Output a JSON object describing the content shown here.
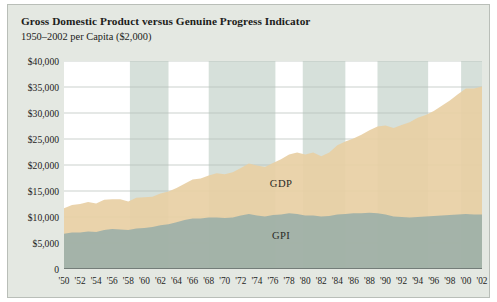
{
  "figure": {
    "title": "Gross Domestic Product versus Genuine Progress Indicator",
    "subtitle": "1950–2002 per Capita ($2,000)",
    "panel_bg": "#e4e8e2",
    "plot_bg": "#ffffff",
    "border_color": "#b9beb8"
  },
  "chart_data": {
    "type": "area",
    "title": "Gross Domestic Product versus Genuine Progress Indicator",
    "subtitle": "1950–2002 per Capita ($2,000)",
    "xlabel": "",
    "ylabel": "",
    "xlim": [
      1950,
      2002
    ],
    "ylim": [
      0,
      40000
    ],
    "grid": true,
    "legend": "inline-labels",
    "ytick_values": [
      0,
      5000,
      10000,
      15000,
      20000,
      25000,
      30000,
      35000,
      40000
    ],
    "ytick_labels": [
      "0",
      "$5,000",
      "$10,000",
      "$15,000",
      "$20,000",
      "$25,000",
      "$30,000",
      "$35,000",
      "$40,000"
    ],
    "xtick_values": [
      1950,
      1952,
      1954,
      1956,
      1958,
      1960,
      1962,
      1964,
      1966,
      1968,
      1970,
      1972,
      1974,
      1976,
      1978,
      1980,
      1982,
      1984,
      1986,
      1988,
      1990,
      1992,
      1994,
      1996,
      1998,
      2000,
      2002
    ],
    "xtick_labels": [
      "'50",
      "'52",
      "'54",
      "'56",
      "'58",
      "'60",
      "'62",
      "'64",
      "'66",
      "'68",
      "'70",
      "'72",
      "'74",
      "'76",
      "'78",
      "'80",
      "'82",
      "'84",
      "'86",
      "'88",
      "'90",
      "'92",
      "'94",
      "'96",
      "'98",
      "'00",
      "'02"
    ],
    "x": [
      1950,
      1951,
      1952,
      1953,
      1954,
      1955,
      1956,
      1957,
      1958,
      1959,
      1960,
      1961,
      1962,
      1963,
      1964,
      1965,
      1966,
      1967,
      1968,
      1969,
      1970,
      1971,
      1972,
      1973,
      1974,
      1975,
      1976,
      1977,
      1978,
      1979,
      1980,
      1981,
      1982,
      1983,
      1984,
      1985,
      1986,
      1987,
      1988,
      1989,
      1990,
      1991,
      1992,
      1993,
      1994,
      1995,
      1996,
      1997,
      1998,
      1999,
      2000,
      2001,
      2002
    ],
    "series": [
      {
        "name": "GDP",
        "label": "GDP",
        "color": "#e8cfa4",
        "values": [
          11700,
          12300,
          12500,
          12900,
          12600,
          13300,
          13400,
          13400,
          13000,
          13700,
          13800,
          13900,
          14500,
          14900,
          15600,
          16400,
          17200,
          17400,
          18000,
          18400,
          18200,
          18600,
          19400,
          20300,
          19900,
          19600,
          20400,
          21100,
          22000,
          22400,
          22000,
          22400,
          21700,
          22400,
          23800,
          24500,
          25100,
          25800,
          26700,
          27400,
          27600,
          27100,
          27700,
          28200,
          29100,
          29600,
          30400,
          31400,
          32400,
          33600,
          34700,
          34700,
          35100
        ]
      },
      {
        "name": "GPI",
        "label": "GPI",
        "color": "#9db0a8",
        "values": [
          6800,
          7000,
          7000,
          7200,
          7100,
          7500,
          7700,
          7600,
          7500,
          7800,
          7900,
          8100,
          8400,
          8600,
          9000,
          9400,
          9700,
          9700,
          9900,
          9900,
          9800,
          9900,
          10300,
          10600,
          10300,
          10100,
          10400,
          10500,
          10700,
          10600,
          10300,
          10300,
          10100,
          10200,
          10500,
          10600,
          10700,
          10700,
          10800,
          10700,
          10500,
          10100,
          10000,
          9900,
          10000,
          10100,
          10200,
          10300,
          10400,
          10500,
          10600,
          10500,
          10500
        ]
      }
    ],
    "shaded_bands": [
      {
        "name": "band-1",
        "start": 1958.2,
        "end": 1963.0
      },
      {
        "name": "band-2",
        "start": 1968.0,
        "end": 1976.3
      },
      {
        "name": "band-3",
        "start": 1979.7,
        "end": 1985.0
      },
      {
        "name": "band-4",
        "start": 1989.0,
        "end": 1995.3
      },
      {
        "name": "band-5",
        "start": 1999.4,
        "end": 2002.0
      }
    ],
    "band_color": "#cfdad3"
  }
}
